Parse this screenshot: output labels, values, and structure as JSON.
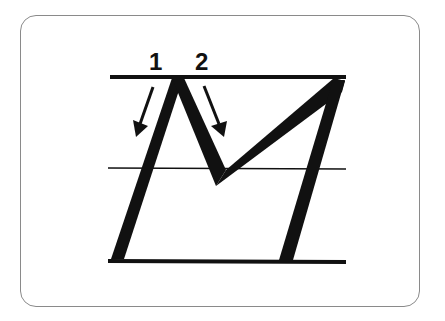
{
  "diagram": {
    "letter": "M",
    "stroke_labels": [
      {
        "label": "1",
        "x": 149,
        "y": 50
      },
      {
        "label": "2",
        "x": 195,
        "y": 50
      }
    ],
    "colors": {
      "ink": "#111111",
      "card_border": "#8a8a8a",
      "background": "#ffffff"
    },
    "guide_lines": [
      "top-line",
      "mid-line",
      "baseline"
    ]
  }
}
